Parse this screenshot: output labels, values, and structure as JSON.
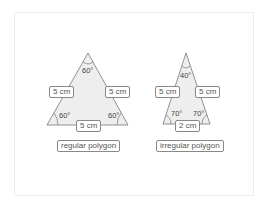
{
  "figures": [
    {
      "caption": "regular polygon",
      "sides": {
        "left": "5 cm",
        "right": "5 cm",
        "bottom": "5 cm"
      },
      "angles": {
        "top": "60°",
        "bottom_left": "60°",
        "bottom_right": "60°"
      }
    },
    {
      "caption": "irregular polygon",
      "sides": {
        "left": "5 cm",
        "right": "5 cm",
        "bottom": "2 cm"
      },
      "angles": {
        "top": "40°",
        "bottom_left": "70°",
        "bottom_right": "70°"
      }
    }
  ],
  "colors": {
    "fill": "#eeeeee",
    "stroke": "#777777"
  }
}
